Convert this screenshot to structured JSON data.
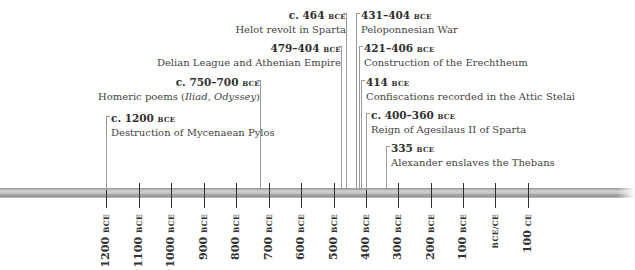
{
  "chart_data": {
    "type": "timeline",
    "axis": {
      "ticks": [
        {
          "year": -1200,
          "num": "1200",
          "era": "BCE",
          "x": 106
        },
        {
          "year": -1100,
          "num": "1100",
          "era": "BCE",
          "x": 139
        },
        {
          "year": -1000,
          "num": "1000",
          "era": "BCE",
          "x": 171
        },
        {
          "year": -900,
          "num": "900",
          "era": "BCE",
          "x": 204
        },
        {
          "year": -800,
          "num": "800",
          "era": "BCE",
          "x": 236
        },
        {
          "year": -700,
          "num": "700",
          "era": "BCE",
          "x": 269
        },
        {
          "year": -600,
          "num": "600",
          "era": "BCE",
          "x": 301
        },
        {
          "year": -500,
          "num": "500",
          "era": "BCE",
          "x": 334
        },
        {
          "year": -400,
          "num": "400",
          "era": "BCE",
          "x": 366
        },
        {
          "year": -300,
          "num": "300",
          "era": "BCE",
          "x": 398
        },
        {
          "year": -200,
          "num": "200",
          "era": "BCE",
          "x": 431
        },
        {
          "year": -100,
          "num": "100",
          "era": "BCE",
          "x": 463
        },
        {
          "year": 0,
          "num": "",
          "era": "BCE/CE",
          "x": 495
        },
        {
          "year": 100,
          "num": "100",
          "era": "CE",
          "x": 528
        }
      ],
      "range": [
        -1200,
        100
      ]
    },
    "events": [
      {
        "date_num": "c. 1200",
        "date_era": "BCE",
        "label": "Destruction of Mycenaean Pylos",
        "year": -1200,
        "x": 106,
        "label_x": 108,
        "label_y": 112,
        "side": "left"
      },
      {
        "date_num": "c. 750–700",
        "date_era": "BCE",
        "label_parts": [
          "Homeric poems (",
          "Iliad",
          ", ",
          "Odyssey",
          ")"
        ],
        "label": "Homeric poems (Iliad, Odyssey)",
        "year": -725,
        "x": 260,
        "label_right": 257,
        "label_y": 76,
        "side": "right"
      },
      {
        "date_num": "479–404",
        "date_era": "BCE",
        "label": "Delian League and Athenian Empire",
        "year": -479,
        "x": 341,
        "label_right": 338,
        "label_y": 42,
        "side": "right"
      },
      {
        "date_num": "c. 464",
        "date_era": "BCE",
        "label": "Helot revolt in Sparta",
        "year": -464,
        "x": 346,
        "label_right": 343,
        "label_y": 9,
        "side": "right"
      },
      {
        "date_num": "431–404",
        "date_era": "BCE",
        "label": "Peloponnesian War",
        "year": -431,
        "x": 356,
        "label_x": 358,
        "label_y": 9,
        "side": "left"
      },
      {
        "date_num": "421–406",
        "date_era": "BCE",
        "label": "Construction of the Erechtheum",
        "year": -421,
        "x": 359,
        "label_x": 361,
        "label_y": 42,
        "side": "left"
      },
      {
        "date_num": "414",
        "date_era": "BCE",
        "label": "Confiscations recorded in the Attic Stelai",
        "year": -414,
        "x": 361,
        "label_x": 363,
        "label_y": 76,
        "side": "left"
      },
      {
        "date_num": "c. 400–360",
        "date_era": "BCE",
        "label": "Reign of Agesilaus II of Sparta",
        "year": -400,
        "x": 366,
        "label_x": 368,
        "label_y": 109,
        "side": "left"
      },
      {
        "date_num": "335",
        "date_era": "BCE",
        "label": "Alexander enslaves the Thebans",
        "year": -335,
        "x": 386,
        "label_x": 388,
        "label_y": 142,
        "side": "left"
      }
    ]
  }
}
